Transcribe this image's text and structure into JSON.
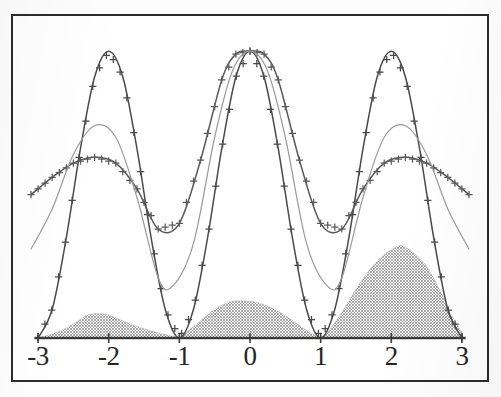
{
  "figure": {
    "title": "",
    "frame_color": "#2b2b2b",
    "background_color": "#ffffff"
  },
  "axis": {
    "x_labels": [
      "-3",
      "-2",
      "-1",
      "0",
      "1",
      "2",
      "3"
    ],
    "x_values": [
      -3,
      -2,
      -1,
      0,
      1,
      2,
      3
    ],
    "axis_line_color": "#3a3a3a",
    "tick_marker": "+"
  },
  "chart_data": {
    "type": "line",
    "title": "",
    "xlabel": "",
    "ylabel": "",
    "xlim": [
      -3.1,
      3.1
    ],
    "ylim": [
      0,
      1.06
    ],
    "grid": false,
    "legend": "none",
    "x_ticks": [
      -3,
      -2,
      -1,
      0,
      1,
      2,
      3
    ],
    "x_tick_labels": [
      "-3",
      "-2",
      "-1",
      "0",
      "1",
      "2",
      "3"
    ],
    "y_ticks": [],
    "y_tick_labels": [],
    "series": [
      {
        "name": "main-marked-curve",
        "style": "line-with-plus-markers",
        "color": "#4a4a4a",
        "marker": "+",
        "description": "high-amplitude oscillation, maxima near x=-2, 0, 2 at y=1.0, zeros at x=-3, -1, 1, 3",
        "x": [
          -3.0,
          -2.8,
          -2.6,
          -2.4,
          -2.2,
          -2.0,
          -1.8,
          -1.6,
          -1.4,
          -1.2,
          -1.0,
          -0.8,
          -0.6,
          -0.4,
          -0.2,
          0.0,
          0.2,
          0.4,
          0.6,
          0.8,
          1.0,
          1.2,
          1.4,
          1.6,
          1.8,
          2.0,
          2.2,
          2.4,
          2.6,
          2.8,
          3.0
        ],
        "y": [
          0.0,
          0.1,
          0.35,
          0.66,
          0.91,
          1.0,
          0.91,
          0.66,
          0.35,
          0.1,
          0.0,
          0.1,
          0.35,
          0.66,
          0.91,
          1.0,
          0.91,
          0.66,
          0.35,
          0.1,
          0.0,
          0.1,
          0.35,
          0.66,
          0.91,
          1.0,
          0.91,
          0.66,
          0.35,
          0.1,
          0.0
        ]
      },
      {
        "name": "secondary-marked-curve",
        "style": "line-with-plus-markers",
        "color": "#5a5a5a",
        "marker": "+",
        "description": "broad low-amplitude curve, flat maxima near x=-2.2 and x=2.2 at y=0.63, central peak at x=0 reaching y=1.0, minima near x=-1.3 and x=1.3",
        "x": [
          -3.1,
          -2.8,
          -2.5,
          -2.2,
          -1.9,
          -1.6,
          -1.3,
          -1.0,
          -0.7,
          -0.4,
          -0.2,
          0.0,
          0.2,
          0.4,
          0.7,
          1.0,
          1.3,
          1.6,
          1.9,
          2.2,
          2.5,
          2.8,
          3.1
        ],
        "y": [
          0.5,
          0.56,
          0.61,
          0.63,
          0.61,
          0.52,
          0.38,
          0.4,
          0.62,
          0.9,
          0.99,
          1.0,
          0.99,
          0.9,
          0.62,
          0.4,
          0.38,
          0.52,
          0.61,
          0.63,
          0.61,
          0.56,
          0.5
        ]
      },
      {
        "name": "tertiary-smooth-curve",
        "style": "line",
        "color": "#9a9a9a",
        "marker": "none",
        "description": "light smooth curve, local maxima near x=-2.2 and x=2.2 at y=0.74, deep minima near x=-1.25 and x=1.25 at y=0.18, central peak at x=0 at y=1.0",
        "x": [
          -3.1,
          -2.8,
          -2.5,
          -2.2,
          -1.9,
          -1.6,
          -1.3,
          -1.1,
          -0.8,
          -0.5,
          -0.25,
          0.0,
          0.25,
          0.5,
          0.8,
          1.1,
          1.3,
          1.6,
          1.9,
          2.2,
          2.5,
          2.8,
          3.1
        ],
        "y": [
          0.31,
          0.45,
          0.64,
          0.74,
          0.7,
          0.49,
          0.21,
          0.18,
          0.33,
          0.7,
          0.93,
          1.0,
          0.93,
          0.7,
          0.33,
          0.18,
          0.21,
          0.49,
          0.7,
          0.74,
          0.64,
          0.45,
          0.31
        ]
      }
    ],
    "filled_area": {
      "name": "shaded-area",
      "style": "filled-dither-gray",
      "color": "#b3b3b3",
      "description": "three humps of increasing height along x, baseline at y=0",
      "x": [
        -3.0,
        -2.8,
        -2.6,
        -2.4,
        -2.3,
        -2.15,
        -2.0,
        -1.8,
        -1.6,
        -1.4,
        -1.2,
        -1.05,
        -1.0,
        -0.9,
        -0.7,
        -0.5,
        -0.3,
        -0.15,
        0.0,
        0.15,
        0.35,
        0.55,
        0.75,
        0.9,
        1.0,
        1.1,
        1.3,
        1.5,
        1.7,
        1.9,
        2.05,
        2.15,
        2.3,
        2.5,
        2.7,
        2.85,
        3.0
      ],
      "y": [
        0.0,
        0.015,
        0.035,
        0.065,
        0.08,
        0.085,
        0.08,
        0.06,
        0.04,
        0.025,
        0.012,
        0.003,
        0.0,
        0.02,
        0.06,
        0.1,
        0.125,
        0.13,
        0.128,
        0.12,
        0.1,
        0.07,
        0.035,
        0.012,
        0.0,
        0.02,
        0.09,
        0.17,
        0.24,
        0.29,
        0.315,
        0.322,
        0.3,
        0.25,
        0.16,
        0.08,
        0.02
      ]
    }
  }
}
